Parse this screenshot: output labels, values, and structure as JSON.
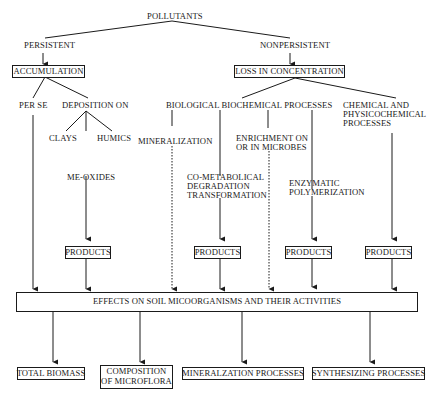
{
  "diagram": {
    "root": "POLLUTANTS",
    "persistent": {
      "label": "PERSISTENT",
      "box": "ACCUMULATION",
      "per_se": "PER SE",
      "deposition_on": "DEPOSITION ON",
      "clays": "CLAYS",
      "humics": "HUMICS",
      "me_oxides": "ME-OXIDES",
      "products": "PRODUCTS"
    },
    "nonpersistent": {
      "label": "NONPERSISTENT",
      "box": "LOSS IN CONCENTRATION",
      "bio_header": "BIOLOGICAL BIOCHEMICAL PROCESSES",
      "mineralization": "MINERALIZATION",
      "cometabolical": [
        "CO-METABOLICAL",
        "DEGRADATION",
        "TRANSFORMATION"
      ],
      "enrichment": [
        "ENRICHMENT ON",
        "OR IN MICROBES"
      ],
      "enzymatic": [
        "ENZYMATIC",
        "POLYMERIZATION"
      ],
      "chemical": [
        "CHEMICAL AND",
        "PHYSICOCHEMICAL",
        "PROCESSES"
      ],
      "products": [
        "PRODUCTS",
        "PRODUCTS",
        "PRODUCTS"
      ]
    },
    "effects_box": "EFFECTS ON SOIL MICOORGANISMS AND THEIR ACTIVITIES",
    "outcomes": [
      {
        "label": "TOTAL BIOMASS"
      },
      {
        "label": [
          "COMPOSITION",
          "OF MICROFLORA"
        ]
      },
      {
        "label": "MINERALZATION PROCESSES"
      },
      {
        "label": "SYNTHESIZING PROCESSES"
      }
    ],
    "colors": {
      "ink": "#1a1a1a",
      "background": "#ffffff"
    },
    "legend_line_styles": {
      "solid": "direct pathway",
      "dotted": "mineralization / enrichment pathway"
    }
  }
}
